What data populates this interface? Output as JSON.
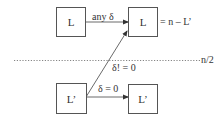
{
  "diagram": {
    "nodes": {
      "top_left": {
        "label": "L"
      },
      "top_right": {
        "label": "L",
        "annotation": "= n – L’"
      },
      "bottom_left": {
        "label": "L’"
      },
      "bottom_right": {
        "label": "L’"
      }
    },
    "edges": {
      "top": {
        "label": "any δ",
        "from": "top_left",
        "to": "top_right"
      },
      "diagonal": {
        "label": "δ! = 0",
        "from": "bottom_left",
        "to": "top_right"
      },
      "bottom": {
        "label": "δ = 0",
        "from": "bottom_left",
        "to": "bottom_right"
      }
    },
    "threshold": {
      "label": "n/2",
      "style": "dotted"
    }
  }
}
